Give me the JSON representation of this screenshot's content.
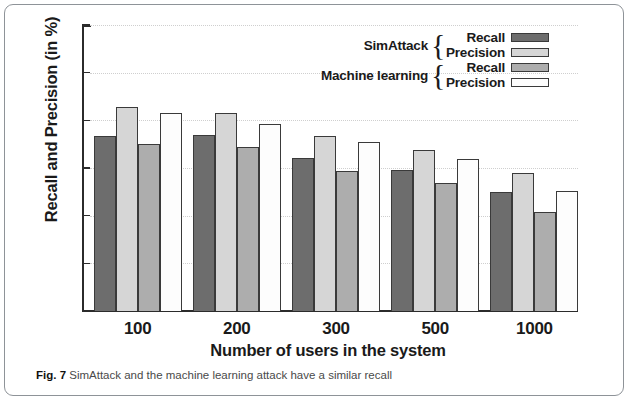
{
  "chart_data": {
    "type": "bar",
    "title": "",
    "xlabel": "Number of users in the system",
    "ylabel": "Recall and Precision (in %)",
    "categories": [
      "100",
      "200",
      "300",
      "500",
      "1000"
    ],
    "ylim": [
      0,
      60
    ],
    "yticks": [
      0,
      10,
      20,
      30,
      40,
      50,
      60
    ],
    "grid": true,
    "legend_position": "top-right",
    "series": [
      {
        "name": "SimAttack Recall",
        "key": "simattack-recall",
        "color": "#6d6d6d",
        "values": [
          36.8,
          36.9,
          32.1,
          29.6,
          25.0
        ]
      },
      {
        "name": "SimAttack Precision",
        "key": "simattack-precision",
        "color": "#d6d6d6",
        "values": [
          42.9,
          41.6,
          36.7,
          33.7,
          29.0
        ]
      },
      {
        "name": "Machine learning Recall",
        "key": "ml-recall",
        "color": "#adadad",
        "values": [
          35.1,
          34.4,
          29.3,
          26.8,
          20.7
        ]
      },
      {
        "name": "Machine learning Precision",
        "key": "ml-precision",
        "color": "#fdfdfd",
        "values": [
          41.6,
          39.2,
          35.4,
          31.8,
          25.1
        ]
      }
    ]
  },
  "legend": {
    "groups": [
      {
        "name": "SimAttack",
        "rows": [
          {
            "label": "Recall",
            "color": "#6d6d6d"
          },
          {
            "label": "Precision",
            "color": "#d6d6d6"
          }
        ]
      },
      {
        "name": "Machine learning",
        "rows": [
          {
            "label": "Recall",
            "color": "#adadad"
          },
          {
            "label": "Precision",
            "color": "#fdfdfd"
          }
        ]
      }
    ]
  },
  "caption": {
    "figure_number": "Fig. 7",
    "text": "SimAttack and the machine learning attack have a similar recall"
  }
}
